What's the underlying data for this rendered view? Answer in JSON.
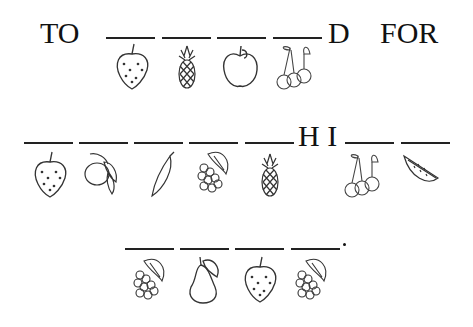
{
  "puzzle": {
    "row1": {
      "prefix": "TO",
      "suffix_letter": "D",
      "next_word": "FOR",
      "fruits": [
        "strawberry",
        "pineapple",
        "apple",
        "cherries"
      ]
    },
    "row2": {
      "middle_letters": "H I",
      "fruits_before": [
        "strawberry",
        "lemon",
        "banana",
        "grapes",
        "pineapple"
      ],
      "fruits_after": [
        "cherries",
        "watermelon"
      ]
    },
    "row3": {
      "end_punct": ".",
      "fruits": [
        "grapes",
        "pear",
        "strawberry",
        "grapes"
      ]
    }
  }
}
